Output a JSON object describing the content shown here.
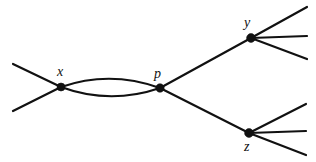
{
  "figure": {
    "type": "feynman-diagram",
    "title": "",
    "background_color": "#ffffff",
    "line_color": "#111111",
    "width": 316,
    "height": 162
  },
  "vertices": [
    {
      "id": "x",
      "label": "x",
      "cx": 61,
      "cy": 87,
      "r": 4.0,
      "label_x": 57,
      "label_y": 76,
      "label_position": "above-left"
    },
    {
      "id": "p",
      "label": "p",
      "cx": 160,
      "cy": 88,
      "r": 4.2,
      "label_x": 154,
      "label_y": 78,
      "label_position": "above-left"
    },
    {
      "id": "y",
      "label": "y",
      "cx": 251,
      "cy": 38,
      "r": 4.4,
      "label_x": 244,
      "label_y": 27,
      "label_position": "above-left"
    },
    {
      "id": "z",
      "label": "z",
      "cx": 249,
      "cy": 133,
      "r": 4.4,
      "label_x": 244,
      "label_y": 151,
      "label_position": "below-left"
    }
  ],
  "external_legs": [
    {
      "name": "incoming-upper-left",
      "x1": 13,
      "y1": 64,
      "x2": 61,
      "y2": 87
    },
    {
      "name": "incoming-lower-left",
      "x1": 13,
      "y1": 111,
      "x2": 61,
      "y2": 87
    },
    {
      "name": "outgoing-y-upper",
      "x1": 251,
      "y1": 38,
      "x2": 307,
      "y2": 7
    },
    {
      "name": "outgoing-y-middle",
      "x1": 251,
      "y1": 38,
      "x2": 307,
      "y2": 36
    },
    {
      "name": "outgoing-y-lower",
      "x1": 251,
      "y1": 38,
      "x2": 307,
      "y2": 59
    },
    {
      "name": "outgoing-z-upper",
      "x1": 249,
      "y1": 133,
      "x2": 306,
      "y2": 104
    },
    {
      "name": "outgoing-z-middle",
      "x1": 249,
      "y1": 133,
      "x2": 306,
      "y2": 131
    },
    {
      "name": "outgoing-z-lower",
      "x1": 249,
      "y1": 133,
      "x2": 306,
      "y2": 155
    }
  ],
  "internal_lines": [
    {
      "name": "p-to-y",
      "x1": 160,
      "y1": 88,
      "x2": 251,
      "y2": 38
    },
    {
      "name": "p-to-z",
      "x1": 160,
      "y1": 88,
      "x2": 249,
      "y2": 133
    }
  ],
  "loop": {
    "name": "x-p-bubble",
    "from": "x",
    "to": "p",
    "upper_path": "M 61 87 Q 110 70 160 88",
    "lower_path": "M 61 87 Q 110 105 160 88"
  },
  "labels": {
    "x": "x",
    "p": "p",
    "y": "y",
    "z": "z"
  }
}
